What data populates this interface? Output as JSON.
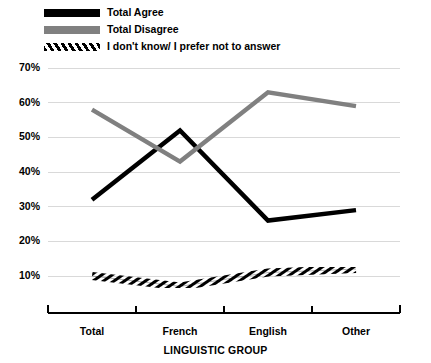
{
  "legend": {
    "items": [
      {
        "label": "Total Agree",
        "swatch": "solid-black-swatch",
        "color": "#000000"
      },
      {
        "label": "Total Disagree",
        "swatch": "solid-gray-swatch",
        "color": "#808080"
      },
      {
        "label": "I don't know/ I prefer not to answer",
        "swatch": "hatched-swatch",
        "color": "#000000"
      }
    ]
  },
  "chart_data": {
    "type": "line",
    "title": "",
    "xlabel": "LINGUISTIC GROUP",
    "ylabel": "",
    "categories": [
      "Total",
      "French",
      "English",
      "Other"
    ],
    "series": [
      {
        "name": "Total Agree",
        "color": "#000000",
        "style": "solid",
        "values": [
          32,
          52,
          26,
          29
        ]
      },
      {
        "name": "Total Disagree",
        "color": "#808080",
        "style": "solid",
        "values": [
          58,
          43,
          63,
          59
        ]
      },
      {
        "name": "I don't know/ I prefer not to answer",
        "color": "#000000",
        "style": "hatched",
        "values": [
          10,
          7,
          11,
          12
        ]
      }
    ],
    "ylim": [
      0,
      70
    ],
    "yticks": [
      10,
      20,
      30,
      40,
      50,
      60,
      70
    ],
    "ytick_labels": [
      "10%",
      "20%",
      "30%",
      "40%",
      "50%",
      "60%",
      "70%"
    ],
    "grid": true,
    "grid_color": "#d9d9d9",
    "legend_position": "top-left"
  }
}
